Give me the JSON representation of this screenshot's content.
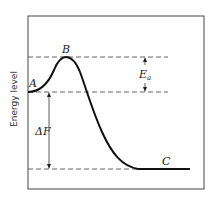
{
  "diagram": {
    "title": "",
    "y_axis_label": "Energy level",
    "points": {
      "A": {
        "label": "A",
        "description": "initial state"
      },
      "B": {
        "label": "B",
        "description": "transition state peak"
      },
      "C": {
        "label": "C",
        "description": "final state"
      }
    },
    "annotations": {
      "activation_energy": {
        "symbol": "E",
        "subscript": "a"
      },
      "free_energy_change": {
        "symbol": "ΔF"
      }
    },
    "colors": {
      "curve": "#111111",
      "dashed": "#555555",
      "frame": "#444444"
    }
  }
}
